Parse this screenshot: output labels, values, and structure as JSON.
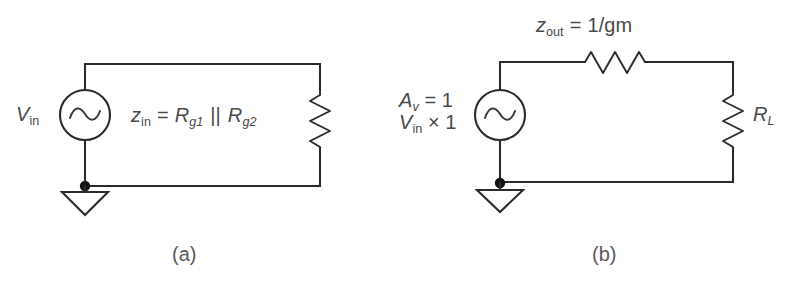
{
  "figure": {
    "type": "circuit-schematic-pair",
    "background_color": "#ffffff",
    "line_color": "#2b2b2b",
    "text_color": "#4a4a4a"
  },
  "circuit_a": {
    "caption": "(a)",
    "source": {
      "icon": "ac-voltage-source-icon",
      "label": "V",
      "label_sub": "in"
    },
    "annotation": {
      "lhs": "z",
      "lhs_sub": "in",
      "equals": "=",
      "term1": "R",
      "term1_sub": "g1",
      "parallel_symbol": "||",
      "term2": "R",
      "term2_sub": "g2",
      "full_text": "z_in = R_g1 || R_g2"
    },
    "load": {
      "icon": "resistor-zigzag-vertical-icon",
      "label": ""
    },
    "ground": {
      "icon": "ground-triangle-icon"
    }
  },
  "circuit_b": {
    "caption": "(b)",
    "source": {
      "icon": "ac-voltage-source-icon",
      "line1": "A",
      "line1_sub": "v",
      "line1_rest": " = 1",
      "line2": "V",
      "line2_sub": "in",
      "line2_rest": " × 1",
      "full_text": "A_v = 1 ; V_in × 1"
    },
    "series_element": {
      "icon": "resistor-zigzag-horizontal-icon",
      "lhs": "z",
      "lhs_sub": "out",
      "equals": "=",
      "rhs": "1/gm",
      "full_text": "z_out = 1/gm"
    },
    "load": {
      "icon": "resistor-zigzag-vertical-icon",
      "label": "R",
      "label_sub": "L"
    },
    "ground": {
      "icon": "ground-triangle-icon"
    }
  }
}
